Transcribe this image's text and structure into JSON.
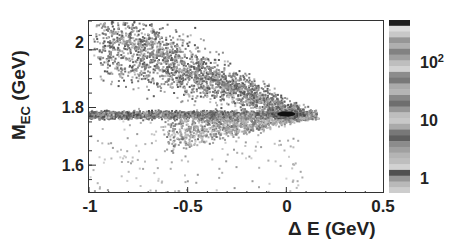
{
  "chart_data": {
    "type": "heatmap",
    "title": "",
    "xlabel": "Δ E (GeV)",
    "ylabel": "M_EC (GeV)",
    "ylabel_main": "M",
    "ylabel_sub": "EC",
    "ylabel_unit": "(GeV)",
    "xlim": [
      -1,
      0.5
    ],
    "ylim": [
      1.5,
      2.1
    ],
    "x_ticks": [
      "-1",
      "-0.5",
      "0",
      "0.5"
    ],
    "x_tick_values": [
      -1,
      -0.5,
      0,
      0.5
    ],
    "y_ticks": [
      "1.6",
      "1.8",
      "2"
    ],
    "y_tick_values": [
      1.6,
      1.8,
      2.0
    ],
    "colorbar": {
      "scale": "log",
      "labels": [
        "1",
        "10",
        "10^2"
      ],
      "label_values": [
        1,
        10,
        100
      ],
      "range": [
        0.5,
        500
      ],
      "colormap": "grayscale"
    },
    "features": [
      {
        "name": "peak",
        "x": 0.0,
        "y": 1.777,
        "intensity": "max (>100)"
      },
      {
        "name": "horizontal band",
        "x_range": [
          -1,
          0.15
        ],
        "y": 1.777
      },
      {
        "name": "upper diagonal band",
        "from": [
          -0.85,
          2.1
        ],
        "to": [
          0.1,
          1.78
        ]
      },
      {
        "name": "lower sparse tail",
        "x_range": [
          -0.6,
          0.0
        ],
        "y_range": [
          1.55,
          1.75
        ]
      }
    ],
    "grid": false,
    "legend": null
  }
}
